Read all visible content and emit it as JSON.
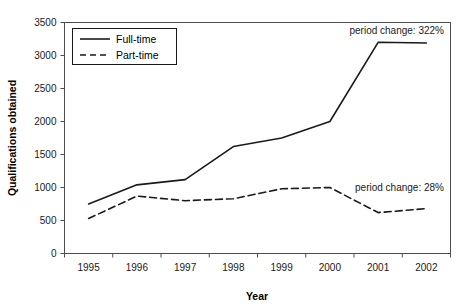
{
  "chart_data": {
    "type": "line",
    "title": "",
    "xlabel": "Year",
    "ylabel": "Qualifications obtained",
    "x": [
      "1995",
      "1996",
      "1997",
      "1998",
      "1999",
      "2000",
      "2001",
      "2002"
    ],
    "categories": [
      "1995",
      "1996",
      "1997",
      "1998",
      "1999",
      "2000",
      "2001",
      "2002"
    ],
    "xticklabels": [
      "1995",
      "1996",
      "1997",
      "1998",
      "1999",
      "2000",
      "2001",
      "2002"
    ],
    "yticklabels": [
      "0",
      "500",
      "1000",
      "1500",
      "2000",
      "2500",
      "3000",
      "3500"
    ],
    "ytickvalues": [
      0,
      500,
      1000,
      1500,
      2000,
      2500,
      3000,
      3500
    ],
    "ylim": [
      0,
      3500
    ],
    "grid": false,
    "legend_position": "upper left",
    "series": [
      {
        "name": "Full-time",
        "style": "solid",
        "color": "#1a1a1a",
        "values": [
          750,
          1040,
          1120,
          1620,
          1750,
          2000,
          3200,
          3190
        ]
      },
      {
        "name": "Part-time",
        "style": "dashed",
        "color": "#1a1a1a",
        "values": [
          530,
          870,
          800,
          830,
          980,
          1000,
          620,
          680
        ]
      }
    ],
    "annotations": [
      {
        "text": "period change: 322%",
        "series": "Full-time"
      },
      {
        "text": "period change: 28%",
        "series": "Part-time"
      }
    ]
  },
  "axes": {
    "x_title": "Year",
    "y_title": "Qualifications obtained",
    "x_ticks": [
      "1995",
      "1996",
      "1997",
      "1998",
      "1999",
      "2000",
      "2001",
      "2002"
    ],
    "y_ticks": [
      "0",
      "500",
      "1000",
      "1500",
      "2000",
      "2500",
      "3000",
      "3500"
    ]
  },
  "legend": {
    "items": [
      {
        "label": "Full-time",
        "style": "solid"
      },
      {
        "label": "Part-time",
        "style": "dashed"
      }
    ]
  },
  "annotations": {
    "fulltime_change": "period change: 322%",
    "parttime_change": "period change: 28%"
  },
  "colors": {
    "line": "#1a1a1a",
    "axis": "#4d4d4d",
    "text": "#1a1a1a",
    "background": "#ffffff"
  }
}
